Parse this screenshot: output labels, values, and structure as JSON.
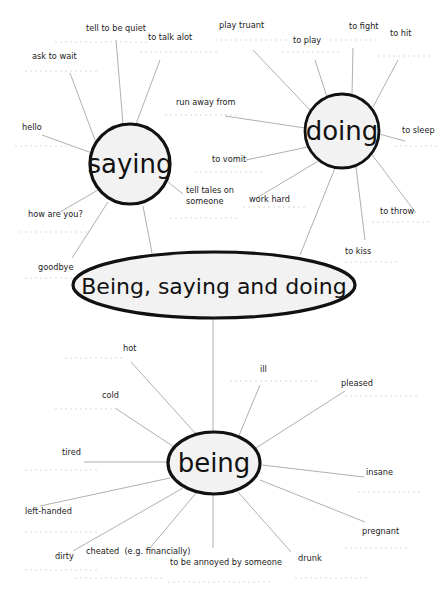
{
  "title": "Being, saying and doing",
  "hubs": {
    "saying": "saying",
    "doing": "doing",
    "being": "being"
  },
  "saying": {
    "items": [
      "tell to be quiet",
      "to talk alot",
      "ask to wait",
      "hello",
      "how are you?",
      "goodbye",
      "tell tales on",
      "someone"
    ]
  },
  "doing": {
    "items": [
      "play truant",
      "to play",
      "to fight",
      "to hit",
      "run away from",
      "to sleep",
      "to vomit",
      "work hard",
      "to throw",
      "to kiss"
    ]
  },
  "being": {
    "items": [
      "hot",
      "cold",
      "ill",
      "pleased",
      "tired",
      "insane",
      "left-handed",
      "pregnant",
      "dirty",
      "cheated  (e.g. financially)",
      "to be annoyed by someone",
      "drunk"
    ]
  },
  "colors": {
    "outline": "#111111",
    "fill": "#f2f2f2",
    "spoke": "#9a9a9a",
    "answer_line": "#cfcfcf"
  }
}
